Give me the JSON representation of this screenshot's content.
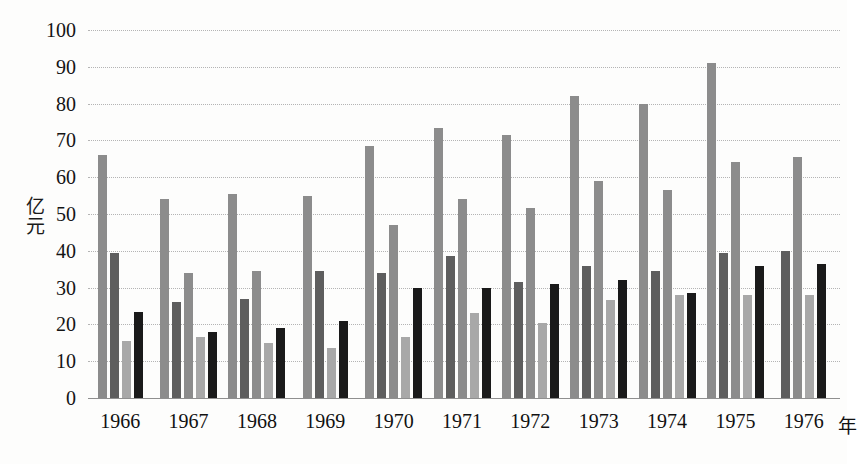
{
  "chart_data": {
    "type": "bar",
    "title": "",
    "xlabel": "年",
    "ylabel": "亿元",
    "ylim": [
      0,
      100
    ],
    "ytick_values": [
      0,
      10,
      20,
      30,
      40,
      50,
      60,
      70,
      80,
      90,
      100
    ],
    "ytick_labels": [
      "0",
      "10",
      "20",
      "30",
      "40",
      "50",
      "60",
      "70",
      "80",
      "90",
      "100"
    ],
    "grid": true,
    "legend": "none",
    "categories": [
      "1966",
      "1967",
      "1968",
      "1969",
      "1970",
      "1971",
      "1972",
      "1973",
      "1974",
      "1975",
      "1976"
    ],
    "series": [
      {
        "name": "series-1",
        "color": "#8c8c8c",
        "values": [
          66.0,
          54.0,
          55.5,
          55.0,
          68.5,
          73.5,
          71.5,
          82.0,
          80.0,
          91.0,
          40.0
        ]
      },
      {
        "name": "series-2",
        "color": "#5e5e5e",
        "values": [
          39.5,
          26.0,
          27.0,
          34.5,
          34.0,
          38.5,
          31.5,
          36.0,
          34.5,
          39.5,
          65.5
        ]
      },
      {
        "name": "series-3",
        "color": "#a8a8a8",
        "values": [
          15.5,
          16.5,
          15.0,
          13.5,
          47.0,
          54.0,
          51.5,
          59.0,
          56.5,
          64.0,
          28.0
        ]
      },
      {
        "name": "series-4",
        "color": "#1a1a1a",
        "values": [
          23.5,
          18.0,
          19.0,
          21.0,
          30.0,
          30.0,
          31.0,
          32.0,
          28.5,
          36.0,
          36.5
        ]
      }
    ],
    "extra_bars": [
      {
        "name": "series-3b",
        "color": "#b0b0b0",
        "note": "mid-light bar present in groups 1967-1976",
        "values": [
          null,
          34.0,
          34.5,
          null,
          16.5,
          23.0,
          20.5,
          26.5,
          28.0,
          28.0,
          null
        ]
      }
    ],
    "groups": [
      {
        "label": "1966",
        "bars": [
          {
            "value": 66.0,
            "color": "#8c8c8c",
            "tone": "mid-gray"
          },
          {
            "value": 39.5,
            "color": "#5e5e5e",
            "tone": "dark-gray"
          },
          {
            "value": 15.5,
            "color": "#a8a8a8",
            "tone": "light-gray"
          },
          {
            "value": 23.5,
            "color": "#1a1a1a",
            "tone": "black"
          }
        ]
      },
      {
        "label": "1967",
        "bars": [
          {
            "value": 54.0,
            "color": "#8c8c8c",
            "tone": "mid-gray"
          },
          {
            "value": 26.0,
            "color": "#5e5e5e",
            "tone": "dark-gray"
          },
          {
            "value": 34.0,
            "color": "#8c8c8c",
            "tone": "mid-gray"
          },
          {
            "value": 16.5,
            "color": "#a8a8a8",
            "tone": "light-gray"
          },
          {
            "value": 18.0,
            "color": "#1a1a1a",
            "tone": "black"
          }
        ]
      },
      {
        "label": "1968",
        "bars": [
          {
            "value": 55.5,
            "color": "#8c8c8c",
            "tone": "mid-gray"
          },
          {
            "value": 27.0,
            "color": "#5e5e5e",
            "tone": "dark-gray"
          },
          {
            "value": 34.5,
            "color": "#8c8c8c",
            "tone": "mid-gray"
          },
          {
            "value": 15.0,
            "color": "#a8a8a8",
            "tone": "light-gray"
          },
          {
            "value": 19.0,
            "color": "#1a1a1a",
            "tone": "black"
          }
        ]
      },
      {
        "label": "1969",
        "bars": [
          {
            "value": 55.0,
            "color": "#8c8c8c",
            "tone": "mid-gray"
          },
          {
            "value": 34.5,
            "color": "#5e5e5e",
            "tone": "dark-gray"
          },
          {
            "value": 13.5,
            "color": "#a8a8a8",
            "tone": "light-gray"
          },
          {
            "value": 21.0,
            "color": "#1a1a1a",
            "tone": "black"
          }
        ]
      },
      {
        "label": "1970",
        "bars": [
          {
            "value": 68.5,
            "color": "#8c8c8c",
            "tone": "mid-gray"
          },
          {
            "value": 34.0,
            "color": "#5e5e5e",
            "tone": "dark-gray"
          },
          {
            "value": 47.0,
            "color": "#8c8c8c",
            "tone": "mid-gray"
          },
          {
            "value": 16.5,
            "color": "#a8a8a8",
            "tone": "light-gray"
          },
          {
            "value": 30.0,
            "color": "#1a1a1a",
            "tone": "black"
          }
        ]
      },
      {
        "label": "1971",
        "bars": [
          {
            "value": 73.5,
            "color": "#8c8c8c",
            "tone": "mid-gray"
          },
          {
            "value": 38.5,
            "color": "#5e5e5e",
            "tone": "dark-gray"
          },
          {
            "value": 54.0,
            "color": "#8c8c8c",
            "tone": "mid-gray"
          },
          {
            "value": 23.0,
            "color": "#a8a8a8",
            "tone": "light-gray"
          },
          {
            "value": 30.0,
            "color": "#1a1a1a",
            "tone": "black"
          }
        ]
      },
      {
        "label": "1972",
        "bars": [
          {
            "value": 71.5,
            "color": "#8c8c8c",
            "tone": "mid-gray"
          },
          {
            "value": 31.5,
            "color": "#5e5e5e",
            "tone": "dark-gray"
          },
          {
            "value": 51.5,
            "color": "#8c8c8c",
            "tone": "mid-gray"
          },
          {
            "value": 20.5,
            "color": "#a8a8a8",
            "tone": "light-gray"
          },
          {
            "value": 31.0,
            "color": "#1a1a1a",
            "tone": "black"
          }
        ]
      },
      {
        "label": "1973",
        "bars": [
          {
            "value": 82.0,
            "color": "#8c8c8c",
            "tone": "mid-gray"
          },
          {
            "value": 36.0,
            "color": "#5e5e5e",
            "tone": "dark-gray"
          },
          {
            "value": 59.0,
            "color": "#8c8c8c",
            "tone": "mid-gray"
          },
          {
            "value": 26.5,
            "color": "#a8a8a8",
            "tone": "light-gray"
          },
          {
            "value": 32.0,
            "color": "#1a1a1a",
            "tone": "black"
          }
        ]
      },
      {
        "label": "1974",
        "bars": [
          {
            "value": 80.0,
            "color": "#8c8c8c",
            "tone": "mid-gray"
          },
          {
            "value": 34.5,
            "color": "#5e5e5e",
            "tone": "dark-gray"
          },
          {
            "value": 56.5,
            "color": "#8c8c8c",
            "tone": "mid-gray"
          },
          {
            "value": 28.0,
            "color": "#a8a8a8",
            "tone": "light-gray"
          },
          {
            "value": 28.5,
            "color": "#1a1a1a",
            "tone": "black"
          }
        ]
      },
      {
        "label": "1975",
        "bars": [
          {
            "value": 91.0,
            "color": "#8c8c8c",
            "tone": "mid-gray"
          },
          {
            "value": 39.5,
            "color": "#5e5e5e",
            "tone": "dark-gray"
          },
          {
            "value": 64.0,
            "color": "#8c8c8c",
            "tone": "mid-gray"
          },
          {
            "value": 28.0,
            "color": "#a8a8a8",
            "tone": "light-gray"
          },
          {
            "value": 36.0,
            "color": "#1a1a1a",
            "tone": "black"
          }
        ]
      },
      {
        "label": "1976",
        "bars": [
          {
            "value": 40.0,
            "color": "#5e5e5e",
            "tone": "dark-gray"
          },
          {
            "value": 65.5,
            "color": "#8c8c8c",
            "tone": "mid-gray"
          },
          {
            "value": 28.0,
            "color": "#a8a8a8",
            "tone": "light-gray"
          },
          {
            "value": 36.5,
            "color": "#1a1a1a",
            "tone": "black"
          }
        ]
      }
    ]
  },
  "axis": {
    "y_title_chars": [
      "亿",
      "元"
    ],
    "x_unit": "年"
  }
}
